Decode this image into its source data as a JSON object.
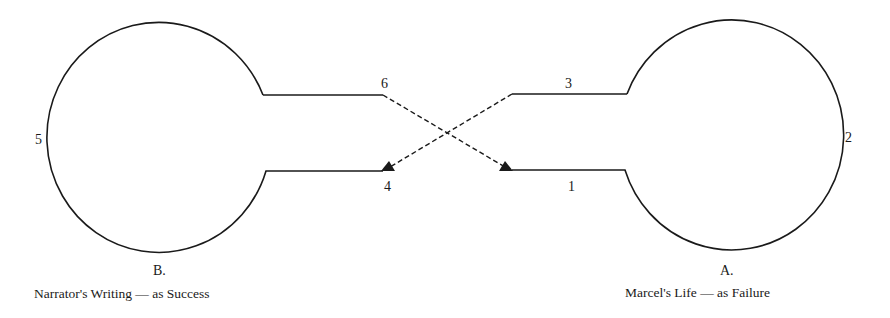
{
  "diagram": {
    "points": {
      "p1": "1",
      "p2": "2",
      "p3": "3",
      "p4": "4",
      "p5": "5",
      "p6": "6"
    },
    "left": {
      "letter": "B.",
      "caption": "Narrator's Writing — as Success"
    },
    "right": {
      "letter": "A.",
      "caption": "Marcel's Life — as Failure"
    },
    "colors": {
      "stroke": "#1a1a1a",
      "background": "#ffffff"
    }
  }
}
